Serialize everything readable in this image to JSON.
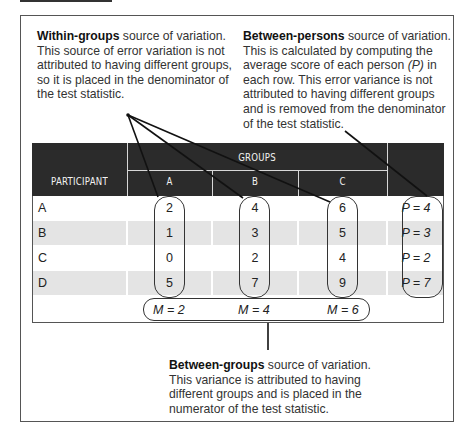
{
  "annotations": {
    "within_groups": {
      "title": "Within-groups",
      "text": " source of variation. This source of error variation is not attributed to having different groups, so it is placed in the denominator of the test statistic."
    },
    "between_persons": {
      "title": "Between-persons",
      "text_a": " source of variation. This is calculated by computing the average score of each person ",
      "p_symbol": "(P)",
      "text_b": " in each row. This error variance is not attributed to having different groups and is removed from the denominator of the test statistic."
    },
    "between_groups": {
      "title": "Between-groups",
      "text": " source of variation. This variance is attributed to having different groups and is placed in the numerator of the test statistic."
    }
  },
  "table": {
    "header": {
      "participant": "PARTICIPANT",
      "groups": "GROUPS",
      "columns": [
        "A",
        "B",
        "C"
      ]
    },
    "rows": [
      {
        "participant": "A",
        "values": [
          "2",
          "4",
          "6"
        ],
        "p": "P = 4"
      },
      {
        "participant": "B",
        "values": [
          "1",
          "3",
          "5"
        ],
        "p": "P = 3"
      },
      {
        "participant": "C",
        "values": [
          "0",
          "2",
          "4"
        ],
        "p": "P = 2"
      },
      {
        "participant": "D",
        "values": [
          "5",
          "7",
          "9"
        ],
        "p": "P = 7"
      }
    ],
    "means": [
      "M = 2",
      "M = 4",
      "M = 6"
    ]
  },
  "colors": {
    "header_bg": "#2b2b2b",
    "shaded_row": "#e4e4e4",
    "border": "#555555",
    "text": "#222222"
  }
}
